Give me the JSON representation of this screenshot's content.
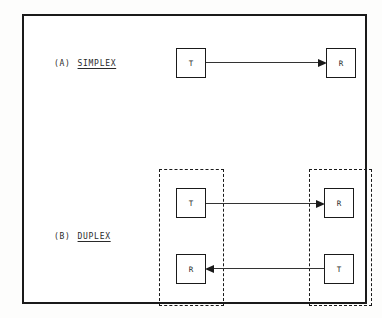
{
  "diagram": {
    "background_color": "#ffffff",
    "line_color": "#1a1a1a",
    "frame": {
      "name": "outer-frame",
      "style": "solid"
    },
    "sections": [
      {
        "id": "a",
        "tag": "(A)",
        "name": "SIMPLEX",
        "underlined": true,
        "nodes": [
          {
            "id": "a-t",
            "label": "T",
            "role": "transmitter"
          },
          {
            "id": "a-r",
            "label": "R",
            "role": "receiver"
          }
        ],
        "links": [
          {
            "id": "arrow-a",
            "from": "a-t",
            "to": "a-r",
            "direction": "right",
            "style": "solid"
          }
        ]
      },
      {
        "id": "b",
        "tag": "(B)",
        "name": "DUPLEX",
        "underlined": true,
        "groups": [
          {
            "id": "station-left",
            "style": "dashed",
            "nodes": [
              {
                "id": "b-left-t",
                "label": "T",
                "role": "transmitter"
              },
              {
                "id": "b-left-r",
                "label": "R",
                "role": "receiver"
              }
            ]
          },
          {
            "id": "station-right",
            "style": "dashed",
            "nodes": [
              {
                "id": "b-right-r",
                "label": "R",
                "role": "receiver"
              },
              {
                "id": "b-right-t",
                "label": "T",
                "role": "transmitter"
              }
            ]
          }
        ],
        "links": [
          {
            "id": "arrow-b-fwd",
            "from": "b-left-t",
            "to": "b-right-r",
            "direction": "right",
            "style": "solid"
          },
          {
            "id": "arrow-b-back",
            "from": "b-right-t",
            "to": "b-left-r",
            "direction": "left",
            "style": "solid"
          }
        ]
      }
    ]
  }
}
